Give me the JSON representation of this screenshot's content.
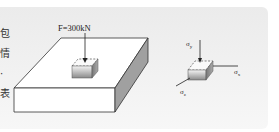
{
  "figure": {
    "type": "stress-element-diagram",
    "side_text": [
      "包",
      "情",
      "·",
      "表"
    ],
    "force_label": "F = 300kN",
    "force_label_text": "F=300kN",
    "stress_labels": {
      "sigma_y": "σy",
      "sigma_x": "σx",
      "sigma_z": "σz"
    },
    "colors": {
      "panel": "#eeeeee",
      "slab_top": "#ffffff",
      "slab_front": "#ffffff",
      "slab_side": "#9a9a9a",
      "outline": "#333333"
    }
  }
}
